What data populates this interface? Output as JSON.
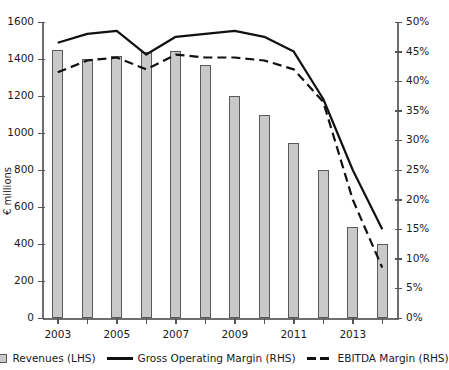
{
  "chart_data": {
    "type": "bar",
    "title": "",
    "subtitle": "",
    "xlabel": "",
    "ylabel": "€ millions",
    "ylabel_right": "",
    "categories": [
      "2003",
      "2004",
      "2005",
      "2006",
      "2007",
      "2008",
      "2009",
      "2010",
      "2011",
      "2012",
      "2013",
      "2014"
    ],
    "x_tick_labels": [
      "2003",
      "",
      "2005",
      "",
      "2007",
      "",
      "2009",
      "",
      "2011",
      "",
      "2013",
      ""
    ],
    "ylim": [
      0,
      1600
    ],
    "y_ticks": [
      0,
      200,
      400,
      600,
      800,
      1000,
      1200,
      1400,
      1600
    ],
    "y_tick_labels": [
      "0",
      "200",
      "400",
      "600",
      "800",
      "1000",
      "1200",
      "1400",
      "1600"
    ],
    "ylim_right": [
      0,
      50
    ],
    "y_ticks_right": [
      0,
      5,
      10,
      15,
      20,
      25,
      30,
      35,
      40,
      45,
      50
    ],
    "y_tick_labels_right": [
      "0%",
      "5%",
      "10%",
      "15%",
      "20%",
      "25%",
      "30%",
      "35%",
      "40%",
      "45%",
      "50%"
    ],
    "grid": false,
    "legend_position": "bottom",
    "series": [
      {
        "name": "Revenues (LHS)",
        "type": "bar",
        "axis": "left",
        "unit": "€ millions",
        "color": "#c9c9c9",
        "edge_color": "#5a5a5a",
        "values": [
          1450,
          1400,
          1415,
          1440,
          1445,
          1370,
          1200,
          1100,
          945,
          800,
          490,
          400
        ]
      },
      {
        "name": "Gross Operating Margin (RHS)",
        "type": "line",
        "axis": "right",
        "unit": "%",
        "style": "solid",
        "color": "#111111",
        "values": [
          46.5,
          48.0,
          48.5,
          44.5,
          47.5,
          48.0,
          48.5,
          47.5,
          45.0,
          37.0,
          25.0,
          15.0
        ]
      },
      {
        "name": "EBITDA Margin (RHS)",
        "type": "line",
        "axis": "right",
        "unit": "%",
        "style": "dashed",
        "color": "#111111",
        "values": [
          41.5,
          43.5,
          44.0,
          42.0,
          44.5,
          44.0,
          44.0,
          43.5,
          42.0,
          36.5,
          20.0,
          8.5
        ]
      }
    ],
    "legend": [
      {
        "label": "Revenues (LHS)",
        "marker": "bar-swatch"
      },
      {
        "label": "Gross Operating Margin (RHS)",
        "marker": "solid-line"
      },
      {
        "label": "EBITDA Margin (RHS)",
        "marker": "dashed-line"
      }
    ]
  }
}
